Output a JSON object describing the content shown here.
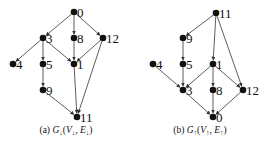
{
  "graphs": [
    {
      "id": "a",
      "caption": "(a) G↓(V↓, E↓)",
      "caption_parts": {
        "prefix": "(a) ",
        "G": "G",
        "sub": "↓",
        "V": "V",
        "E": "E"
      },
      "nodes": [
        {
          "id": "0",
          "x": 74,
          "y": 12
        },
        {
          "id": "3",
          "x": 43,
          "y": 38
        },
        {
          "id": "8",
          "x": 74,
          "y": 38
        },
        {
          "id": "12",
          "x": 103,
          "y": 38
        },
        {
          "id": "4",
          "x": 13,
          "y": 64
        },
        {
          "id": "5",
          "x": 43,
          "y": 64
        },
        {
          "id": "1",
          "x": 74,
          "y": 64
        },
        {
          "id": "9",
          "x": 43,
          "y": 90
        },
        {
          "id": "11",
          "x": 77,
          "y": 117
        }
      ],
      "edges": [
        [
          "0",
          "3"
        ],
        [
          "0",
          "8"
        ],
        [
          "0",
          "12"
        ],
        [
          "3",
          "4"
        ],
        [
          "3",
          "5"
        ],
        [
          "3",
          "1"
        ],
        [
          "8",
          "1"
        ],
        [
          "12",
          "1"
        ],
        [
          "12",
          "11"
        ],
        [
          "5",
          "9"
        ],
        [
          "9",
          "11"
        ],
        [
          "1",
          "11"
        ]
      ]
    },
    {
      "id": "b",
      "caption": "(b) G↑(V↑, E↑)",
      "caption_parts": {
        "prefix": "(b) ",
        "G": "G",
        "sub": "↑",
        "V": "V",
        "E": "E"
      },
      "nodes": [
        {
          "id": "11",
          "x": 216,
          "y": 13
        },
        {
          "id": "9",
          "x": 183,
          "y": 38
        },
        {
          "id": "4",
          "x": 153,
          "y": 64
        },
        {
          "id": "5",
          "x": 183,
          "y": 64
        },
        {
          "id": "1",
          "x": 213,
          "y": 64
        },
        {
          "id": "3",
          "x": 183,
          "y": 90
        },
        {
          "id": "8",
          "x": 213,
          "y": 90
        },
        {
          "id": "12",
          "x": 243,
          "y": 90
        },
        {
          "id": "0",
          "x": 213,
          "y": 117
        }
      ],
      "edges": [
        [
          "11",
          "9"
        ],
        [
          "11",
          "1"
        ],
        [
          "11",
          "12"
        ],
        [
          "9",
          "5"
        ],
        [
          "5",
          "3"
        ],
        [
          "4",
          "3"
        ],
        [
          "1",
          "3"
        ],
        [
          "1",
          "8"
        ],
        [
          "1",
          "12"
        ],
        [
          "3",
          "0"
        ],
        [
          "8",
          "0"
        ],
        [
          "12",
          "0"
        ]
      ]
    }
  ]
}
